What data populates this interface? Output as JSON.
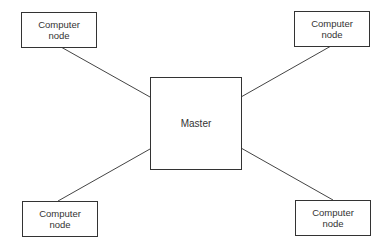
{
  "diagram": {
    "type": "star-topology",
    "center": {
      "label": "Master"
    },
    "nodes": [
      {
        "id": "top-left",
        "label": "Computer\nnode"
      },
      {
        "id": "top-right",
        "label": "Computer\nnode"
      },
      {
        "id": "bottom-left",
        "label": "Computer\nnode"
      },
      {
        "id": "bottom-right",
        "label": "Computer\nnode"
      }
    ],
    "edges": [
      {
        "from": "top-left",
        "to": "master"
      },
      {
        "from": "top-right",
        "to": "master"
      },
      {
        "from": "bottom-left",
        "to": "master"
      },
      {
        "from": "bottom-right",
        "to": "master"
      }
    ]
  }
}
